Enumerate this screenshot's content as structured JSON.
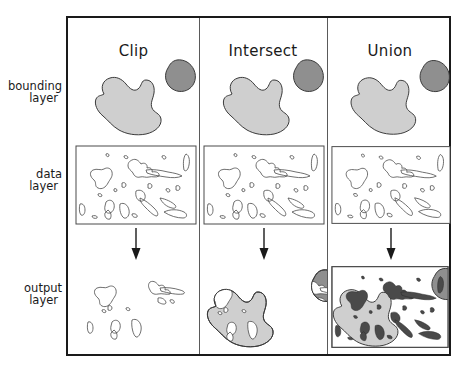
{
  "figure": {
    "columns": [
      {
        "id": "clip",
        "label": "Clip"
      },
      {
        "id": "intersect",
        "label": "Intersect"
      },
      {
        "id": "union",
        "label": "Union"
      }
    ],
    "rows": [
      {
        "id": "bounding",
        "line1": "bounding",
        "line2": "layer"
      },
      {
        "id": "data",
        "line1": "data",
        "line2": "layer"
      },
      {
        "id": "output",
        "line1": "output",
        "line2": "layer"
      }
    ],
    "arrow": {
      "name": "down-arrow",
      "direction": "down",
      "count": 3
    },
    "colors": {
      "frame_border": "#1a1a1a",
      "column_divider": "#5a5a5a",
      "bounding_polygon_light": "#cfcfcf",
      "bounding_polygon_dark": "#8f8f8f",
      "polygon_outline": "#3a3a3a",
      "data_feature_outline": "#4a4a4a",
      "map_border": "#4a4a4a",
      "background": "#ffffff",
      "text": "#1a1a1a"
    },
    "descriptions": {
      "bounding_layer": "Two filled polygons: a large light-gray blob at lower left and a smaller dark-gray blob at upper right.",
      "data_layer": "A rectangular map extent containing many unfilled outlined polygon features.",
      "clip_output": "Only the outlined data features falling inside the bounding polygons; bounding polygons themselves are not retained.",
      "intersect_output": "The two bounding polygons retained and filled, with the overlapping data features shown as white cut-outs inside them.",
      "union_output": "Full rectangular map extent retaining the bounding polygons filled plus all data features filled dark, combined together."
    }
  }
}
